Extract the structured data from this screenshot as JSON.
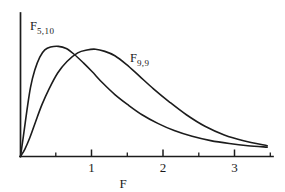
{
  "chart_data": {
    "type": "line",
    "title": "",
    "subtitle": "",
    "xlabel": "F",
    "ylabel": "",
    "xlim": [
      0,
      3.53
    ],
    "ylim": [
      0,
      1.0
    ],
    "grid": false,
    "legend_position": "inline-annotations",
    "x_ticks_major": [
      1,
      2,
      3
    ],
    "x_tick_labels": [
      "1",
      "2",
      "3"
    ],
    "x_ticks_minor": [
      0.5,
      1.5,
      2.5,
      3.5
    ],
    "annotations": [
      {
        "text": "F",
        "subscript": "5,10",
        "x_data": 0.45,
        "y_data": 0.93
      },
      {
        "text": "F",
        "subscript": "9,9",
        "x_data": 1.68,
        "y_data": 0.72
      }
    ],
    "series": [
      {
        "name": "F_5,10",
        "label_base": "F",
        "label_sub": "5,10",
        "color": "#1c1c1c",
        "peak_x": 0.53,
        "peak_y": 0.765,
        "x": [
          0.0,
          0.04,
          0.09,
          0.14,
          0.2,
          0.27,
          0.34,
          0.42,
          0.53,
          0.64,
          0.75,
          0.88,
          1.0,
          1.15,
          1.32,
          1.5,
          1.7,
          1.92,
          2.15,
          2.4,
          2.66,
          2.92,
          3.18,
          3.45
        ],
        "y": [
          0.0,
          0.14,
          0.32,
          0.48,
          0.6,
          0.69,
          0.74,
          0.76,
          0.765,
          0.75,
          0.71,
          0.65,
          0.59,
          0.51,
          0.43,
          0.36,
          0.29,
          0.23,
          0.18,
          0.14,
          0.11,
          0.09,
          0.075,
          0.065
        ]
      },
      {
        "name": "F_9,9",
        "label_base": "F",
        "label_sub": "9,9",
        "color": "#1c1c1c",
        "peak_x": 1.05,
        "peak_y": 0.745,
        "x": [
          0.0,
          0.06,
          0.13,
          0.21,
          0.3,
          0.4,
          0.52,
          0.65,
          0.8,
          0.93,
          1.05,
          1.18,
          1.32,
          1.48,
          1.66,
          1.86,
          2.08,
          2.32,
          2.58,
          2.85,
          3.12,
          3.45
        ],
        "y": [
          0.0,
          0.05,
          0.13,
          0.24,
          0.36,
          0.47,
          0.58,
          0.66,
          0.72,
          0.74,
          0.745,
          0.73,
          0.7,
          0.64,
          0.56,
          0.47,
          0.38,
          0.29,
          0.21,
          0.15,
          0.11,
          0.075
        ]
      }
    ]
  },
  "axis": {
    "x_label": "F",
    "tick_1": "1",
    "tick_2": "2",
    "tick_3": "3"
  },
  "labels": {
    "curve_a_base": "F",
    "curve_a_sub": "5,10",
    "curve_b_base": "F",
    "curve_b_sub": "9,9"
  }
}
